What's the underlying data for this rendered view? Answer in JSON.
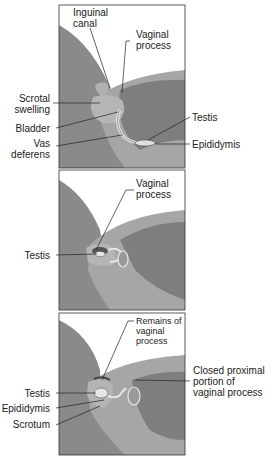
{
  "figure": {
    "panels": [
      {
        "id": "panel-1",
        "labels": {
          "inguinal_canal": [
            "Inguinal",
            "canal"
          ],
          "vaginal_process": [
            "Vaginal",
            "process"
          ],
          "scrotal_swelling": [
            "Scrotal",
            "swelling"
          ],
          "bladder": "Bladder",
          "vas_deferens": [
            "Vas",
            "deferens"
          ],
          "testis": "Testis",
          "epididymis": "Epididymis"
        }
      },
      {
        "id": "panel-2",
        "labels": {
          "vaginal_process": [
            "Vaginal",
            "process"
          ],
          "testis": "Testis"
        }
      },
      {
        "id": "panel-3",
        "labels": {
          "remains_vaginal_process": [
            "Remains of",
            "vaginal",
            "process"
          ],
          "closed_proximal": [
            "Closed proximal",
            "portion of",
            "vaginal process"
          ],
          "testis": "Testis",
          "epididymis": "Epididymis",
          "scrotum": "Scrotum"
        }
      }
    ],
    "colors": {
      "background": "#ffffff",
      "border": "#333333",
      "tissue_dark": "#7d7d7d",
      "tissue_mid": "#9a9a9a",
      "tissue_light": "#b4b4b4",
      "highlight": "#e6e6e6",
      "leader": "#222222"
    }
  }
}
